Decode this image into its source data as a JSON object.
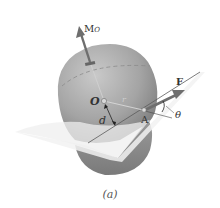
{
  "figure": {
    "caption": "(a)",
    "labels": {
      "moment": "M",
      "moment_sub": "O",
      "origin": "O",
      "distance": "d",
      "point": "A",
      "force": "F",
      "angle": "θ",
      "position_vector": "r"
    },
    "colors": {
      "sphere_light": "#b8b8b8",
      "sphere_dark": "#7a7a7a",
      "plane": "#f0f0f0",
      "vector": "#6e6e6e",
      "text": "#333333"
    }
  }
}
